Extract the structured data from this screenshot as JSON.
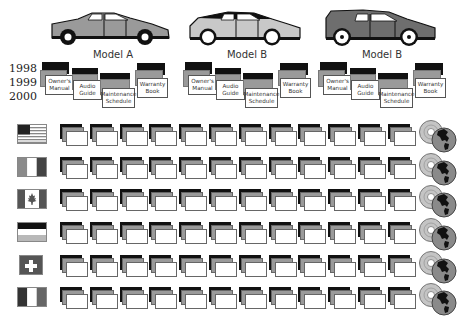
{
  "cars": [
    {
      "label": "Model A",
      "body_color": "#9a9a9a",
      "roof_color": "#9a9a9a",
      "wheel_style": "black-hub"
    },
    {
      "label": "Model B",
      "body_color": "#c8c8c8",
      "roof_color": "#111111",
      "wheel_style": "white-rim"
    },
    {
      "label": "Model B",
      "body_color": "#6e6e6e",
      "roof_color": "#6e6e6e",
      "wheel_style": "white-rim-dot"
    }
  ],
  "years": [
    "1998",
    "1999",
    "2000"
  ],
  "documents": [
    {
      "line1": "Owner's",
      "line2": "Manual"
    },
    {
      "line1": "Audio",
      "line2": "Guide"
    },
    {
      "line1": "Maintenance",
      "line2": "Schedule"
    },
    {
      "line1": "Warranty",
      "line2": "Book"
    }
  ],
  "rows": [
    {
      "country": "USA",
      "flag": "us-flag-icon"
    },
    {
      "country": "Italy",
      "flag": "italy-flag-icon"
    },
    {
      "country": "Canada",
      "flag": "canada-flag-icon"
    },
    {
      "country": "Germany",
      "flag": "germany-flag-icon"
    },
    {
      "country": "Switzerland",
      "flag": "switzerland-flag-icon"
    },
    {
      "country": "France",
      "flag": "france-flag-icon"
    }
  ],
  "stacks_per_row": 12,
  "end_icon": "cd-globe-icon",
  "colors": {
    "black": "#111111",
    "grey": "#9a9a9a",
    "dark_grey": "#555555",
    "light_grey": "#c8c8c8"
  }
}
